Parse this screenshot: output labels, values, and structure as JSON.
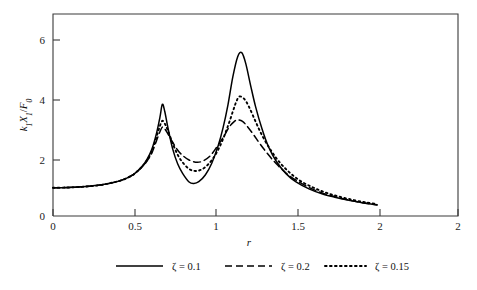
{
  "figure": {
    "background_color": "#ffffff",
    "axis_color": "#3a3a3a",
    "curve_color": "#000000"
  },
  "chart_data": {
    "type": "line",
    "title": "",
    "subtitle": "",
    "xlabel": "r",
    "ylabel": "k₁X₁/F₀",
    "ylabel_parts": {
      "k": "k",
      "k_sub": "1",
      "X": "X",
      "X_sub": "1",
      "slash": "/",
      "F": "F",
      "F_sub": "0"
    },
    "xlim": [
      0,
      2.5
    ],
    "ylim": [
      0,
      7
    ],
    "grid": false,
    "legend_position": "below-axes",
    "x_ticks": [
      0,
      0.5,
      1,
      1.5,
      2,
      2.5
    ],
    "x_tick_labels": [
      "0",
      "0.5",
      "1",
      "1.5",
      "2",
      "2"
    ],
    "y_ticks": [
      0,
      2,
      4,
      6
    ],
    "y_tick_labels": [
      "0",
      "2",
      "4",
      "6"
    ],
    "x_range_of_data": [
      0,
      2
    ],
    "annotations": [],
    "series": [
      {
        "name": "ζ = 0.1",
        "zeta": 0.1,
        "style": "solid",
        "color": "#000000",
        "peak1": {
          "r": 0.675,
          "value": 3.87
        },
        "valley": {
          "r": 0.87,
          "value": 1.13
        },
        "peak2": {
          "r": 1.165,
          "value": 5.66
        },
        "x": [
          0.0,
          0.1,
          0.2,
          0.3,
          0.4,
          0.45,
          0.5,
          0.55,
          0.58,
          0.61,
          0.64,
          0.66,
          0.675,
          0.69,
          0.71,
          0.74,
          0.77,
          0.8,
          0.84,
          0.87,
          0.9,
          0.94,
          0.98,
          1.02,
          1.05,
          1.08,
          1.11,
          1.14,
          1.165,
          1.19,
          1.22,
          1.25,
          1.29,
          1.33,
          1.38,
          1.44,
          1.5,
          1.58,
          1.66,
          1.74,
          1.82,
          1.9,
          2.0
        ],
        "y": [
          0.98,
          0.99,
          1.02,
          1.08,
          1.2,
          1.3,
          1.45,
          1.72,
          1.96,
          2.31,
          2.89,
          3.42,
          3.87,
          3.62,
          3.04,
          2.3,
          1.8,
          1.48,
          1.18,
          1.13,
          1.19,
          1.42,
          1.83,
          2.44,
          3.06,
          3.85,
          4.82,
          5.52,
          5.66,
          5.28,
          4.52,
          3.8,
          3.02,
          2.4,
          1.88,
          1.46,
          1.18,
          0.94,
          0.77,
          0.65,
          0.55,
          0.47,
          0.38
        ]
      },
      {
        "name": "ζ = 0.2",
        "zeta": 0.2,
        "style": "dashed",
        "color": "#000000",
        "peak1": {
          "r": 0.675,
          "value": 3.08
        },
        "valley": {
          "r": 0.89,
          "value": 1.86
        },
        "peak2": {
          "r": 1.14,
          "value": 3.33
        },
        "x": [
          0.0,
          0.1,
          0.2,
          0.3,
          0.4,
          0.45,
          0.5,
          0.55,
          0.58,
          0.61,
          0.64,
          0.66,
          0.675,
          0.69,
          0.71,
          0.74,
          0.77,
          0.8,
          0.84,
          0.89,
          0.93,
          0.97,
          1.01,
          1.05,
          1.09,
          1.12,
          1.14,
          1.17,
          1.2,
          1.24,
          1.28,
          1.33,
          1.38,
          1.44,
          1.5,
          1.58,
          1.66,
          1.74,
          1.82,
          1.9,
          2.0
        ],
        "y": [
          0.98,
          0.99,
          1.02,
          1.08,
          1.2,
          1.3,
          1.45,
          1.7,
          1.9,
          2.18,
          2.63,
          2.92,
          3.08,
          3.02,
          2.84,
          2.54,
          2.28,
          2.1,
          1.94,
          1.86,
          1.92,
          2.08,
          2.38,
          2.72,
          3.1,
          3.28,
          3.33,
          3.28,
          3.1,
          2.8,
          2.48,
          2.12,
          1.8,
          1.48,
          1.24,
          0.99,
          0.8,
          0.67,
          0.56,
          0.47,
          0.39
        ]
      },
      {
        "name": "ζ = 0.15",
        "zeta": 0.15,
        "style": "dotted",
        "color": "#000000",
        "peak1": {
          "r": 0.675,
          "value": 3.3
        },
        "valley": {
          "r": 0.88,
          "value": 1.56
        },
        "peak2": {
          "r": 1.15,
          "value": 4.14
        },
        "x": [
          0.0,
          0.1,
          0.2,
          0.3,
          0.4,
          0.45,
          0.5,
          0.55,
          0.58,
          0.61,
          0.64,
          0.66,
          0.675,
          0.69,
          0.71,
          0.74,
          0.77,
          0.8,
          0.84,
          0.88,
          0.92,
          0.96,
          1.0,
          1.04,
          1.08,
          1.11,
          1.13,
          1.15,
          1.18,
          1.21,
          1.25,
          1.29,
          1.34,
          1.39,
          1.45,
          1.52,
          1.6,
          1.68,
          1.76,
          1.85,
          1.93,
          2.0
        ],
        "y": [
          0.98,
          0.99,
          1.02,
          1.08,
          1.2,
          1.3,
          1.45,
          1.71,
          1.93,
          2.24,
          2.76,
          3.12,
          3.3,
          3.2,
          2.95,
          2.5,
          2.12,
          1.86,
          1.63,
          1.56,
          1.62,
          1.8,
          2.1,
          2.54,
          3.12,
          3.62,
          3.94,
          4.14,
          4.06,
          3.78,
          3.28,
          2.8,
          2.32,
          1.92,
          1.56,
          1.24,
          1.0,
          0.82,
          0.68,
          0.56,
          0.47,
          0.41
        ]
      }
    ],
    "legend": [
      {
        "label": "ζ = 0.1",
        "style": "solid",
        "symbol": "ζ",
        "equals": "=",
        "value": "0.1"
      },
      {
        "label": "ζ = 0.2",
        "style": "dashed",
        "symbol": "ζ",
        "equals": "=",
        "value": "0.2"
      },
      {
        "label": "ζ = 0.15",
        "style": "dotted",
        "symbol": "ζ",
        "equals": "=",
        "value": "0.15"
      }
    ]
  }
}
